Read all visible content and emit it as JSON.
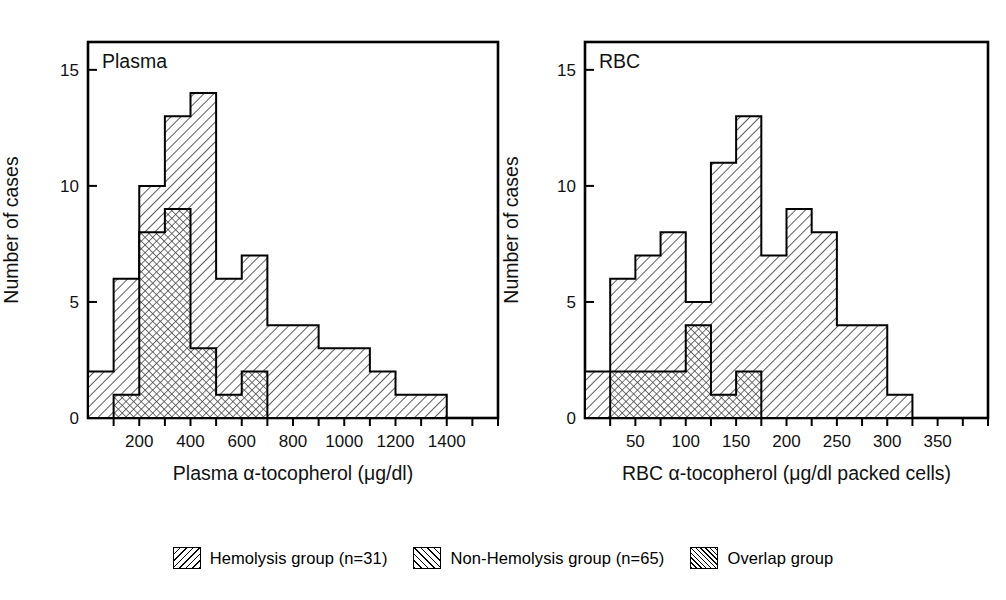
{
  "figure": {
    "y_axis_label": "Number of cases",
    "y_ticks": [
      0,
      5,
      10,
      15
    ],
    "y_max": 16.2
  },
  "panels": [
    {
      "id": "plasma",
      "panel_label": "Plasma",
      "xlabel": "Plasma α-tocopherol (μg/dl)",
      "x_min": 0,
      "x_max": 1600,
      "x_tick_step": 100,
      "x_labels": [
        200,
        400,
        600,
        800,
        1000,
        1200,
        1400
      ],
      "bin_width": 100,
      "series": [
        {
          "name": "Non-Hemolysis group",
          "pattern": "forward-hatch",
          "bin_starts": [
            0,
            100,
            200,
            300,
            400,
            500,
            600,
            700,
            800,
            900,
            1000,
            1100,
            1200,
            1300,
            1400
          ],
          "values": [
            2,
            6,
            10,
            13,
            14,
            6,
            7,
            4,
            4,
            3,
            3,
            2,
            1,
            1,
            0
          ]
        },
        {
          "name": "Overlap group",
          "pattern": "cross-hatch",
          "bin_starts": [
            0,
            100,
            200,
            300,
            400,
            500,
            600,
            700
          ],
          "values": [
            0,
            1,
            8,
            9,
            3,
            1,
            2,
            0
          ]
        }
      ]
    },
    {
      "id": "rbc",
      "panel_label": "RBC",
      "xlabel": "RBC α-tocopherol (μg/dl packed cells)",
      "x_min": 0,
      "x_max": 400,
      "x_tick_step": 25,
      "x_labels": [
        50,
        100,
        150,
        200,
        250,
        300,
        350
      ],
      "bin_width": 25,
      "series": [
        {
          "name": "Non-Hemolysis group",
          "pattern": "forward-hatch",
          "bin_starts": [
            0,
            25,
            50,
            75,
            100,
            125,
            150,
            175,
            200,
            225,
            250,
            275,
            300,
            325,
            350,
            375
          ],
          "values": [
            2,
            6,
            7,
            8,
            5,
            11,
            13,
            7,
            9,
            8,
            4,
            4,
            1,
            0,
            0,
            0
          ]
        },
        {
          "name": "Overlap group",
          "pattern": "cross-hatch",
          "bin_starts": [
            0,
            25,
            50,
            75,
            100,
            125,
            150,
            175
          ],
          "values": [
            0,
            2,
            2,
            2,
            4,
            1,
            2,
            0
          ]
        }
      ]
    }
  ],
  "legend": {
    "items": [
      {
        "label": "Hemolysis group (n=31)",
        "pattern": "back-hatch"
      },
      {
        "label": "Non-Hemolysis group (n=65)",
        "pattern": "forward-hatch"
      },
      {
        "label": "Overlap group",
        "pattern": "cross-hatch"
      }
    ]
  },
  "chart_data": {
    "type": "bar",
    "title": "",
    "charts": [
      {
        "title": "Plasma",
        "xlabel": "Plasma α-tocopherol (μg/dl)",
        "ylabel": "Number of cases",
        "xlim": [
          0,
          1600
        ],
        "ylim": [
          0,
          16
        ],
        "grid": false,
        "legend_position": "bottom",
        "categories": [
          "0-100",
          "100-200",
          "200-300",
          "300-400",
          "400-500",
          "500-600",
          "600-700",
          "700-800",
          "800-900",
          "900-1000",
          "1000-1100",
          "1100-1200",
          "1200-1300",
          "1300-1400",
          "1400-1500"
        ],
        "series": [
          {
            "name": "Non-Hemolysis group (n=65)",
            "values": [
              2,
              6,
              10,
              13,
              14,
              6,
              7,
              4,
              4,
              3,
              3,
              2,
              1,
              1,
              0
            ]
          },
          {
            "name": "Overlap group",
            "values": [
              0,
              1,
              8,
              9,
              3,
              1,
              2,
              0,
              0,
              0,
              0,
              0,
              0,
              0,
              0
            ]
          }
        ]
      },
      {
        "title": "RBC",
        "xlabel": "RBC α-tocopherol (μg/dl packed cells)",
        "ylabel": "Number of cases",
        "xlim": [
          0,
          400
        ],
        "ylim": [
          0,
          16
        ],
        "grid": false,
        "legend_position": "bottom",
        "categories": [
          "0-25",
          "25-50",
          "50-75",
          "75-100",
          "100-125",
          "125-150",
          "150-175",
          "175-200",
          "200-225",
          "225-250",
          "250-275",
          "275-300",
          "300-325",
          "325-350",
          "350-375",
          "375-400"
        ],
        "series": [
          {
            "name": "Non-Hemolysis group (n=65)",
            "values": [
              2,
              6,
              7,
              8,
              5,
              11,
              13,
              7,
              9,
              8,
              4,
              4,
              1,
              0,
              0,
              0
            ]
          },
          {
            "name": "Overlap group",
            "values": [
              0,
              2,
              2,
              2,
              4,
              1,
              2,
              0,
              0,
              0,
              0,
              0,
              0,
              0,
              0,
              0
            ]
          }
        ]
      }
    ]
  }
}
